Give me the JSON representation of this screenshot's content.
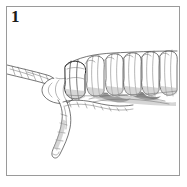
{
  "panel": {
    "step_number": "1",
    "background_color": "#ffffff",
    "frame_color": "#9a9a9a",
    "ink_color": "#3a3a3a",
    "shadow_color": "#555555"
  },
  "illustration": {
    "name": "rope-whipping-knot-step-1",
    "subject": "rope whipping / seizing knot",
    "technique": "pen and pencil line art, hatched shading",
    "elements": [
      {
        "name": "rope-standing-part",
        "description": "twisted three-strand rope entering from the left frame edge, angling down to the right"
      },
      {
        "name": "rope-loop-bight",
        "description": "bulbous rounded bight of rope laid against the standing part at the start of the whipping"
      },
      {
        "name": "whipping-coils",
        "description": "series of tight turns wrapped around the rope, running left to right to the frame edge",
        "coil_count": 11
      },
      {
        "name": "rope-working-end",
        "description": "twisted tail of rope descending down and to the left below the knot"
      },
      {
        "name": "under-shadow",
        "description": "hatched grey shading beneath the row of coils"
      }
    ]
  }
}
